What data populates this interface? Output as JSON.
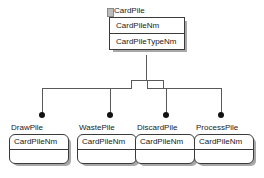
{
  "diagram": {
    "type": "uml-class-diagram",
    "background_color": "#ffffff",
    "line_color": "#5a5a5a",
    "border_color": "#3a3a3a",
    "shadow_color": "#a8a8a8",
    "marker_color": "#121212",
    "root": {
      "name": "CardPile",
      "attributes": [
        "CardPileNm",
        "CardPileTypeNm"
      ]
    },
    "children": [
      {
        "name": "DrawPile",
        "attributes": [
          "CardPileNm"
        ]
      },
      {
        "name": "WastePile",
        "attributes": [
          "CardPileNm"
        ]
      },
      {
        "name": "DiscardPile",
        "attributes": [
          "CardPileNm"
        ]
      },
      {
        "name": "ProcessPile",
        "attributes": [
          "CardPileNm"
        ]
      }
    ]
  }
}
